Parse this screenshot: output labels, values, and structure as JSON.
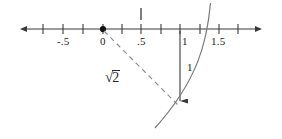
{
  "figure": {
    "stroke_color": "#3a3a3a",
    "dash_color": "#8a8a8a",
    "arc_color": "#7a7a7a",
    "text_color": "#1c1c1c",
    "background": "#ffffff"
  },
  "number_line": {
    "name": "real-number-line",
    "left_arrow": true,
    "right_arrow": true,
    "ticks": [
      {
        "label": "",
        "value": "-0.75"
      },
      {
        "label": "-.5",
        "value": "-0.5"
      },
      {
        "label": "",
        "value": "-0.25"
      },
      {
        "label": "0",
        "value": "0"
      },
      {
        "label": "",
        "value": "0.25"
      },
      {
        "label": ".5",
        "value": "0.5"
      },
      {
        "label": "",
        "value": "0.75"
      },
      {
        "label": "1",
        "value": "1"
      },
      {
        "label": "",
        "value": "1.25"
      },
      {
        "label": "1.5",
        "value": "1.5"
      },
      {
        "label": "",
        "value": "1.75"
      }
    ],
    "labels": {
      "neg_half": "-.5",
      "zero": "0",
      "half": ".5",
      "one": "1",
      "one_half": "1.5"
    },
    "origin_dot": {
      "name": "origin-point",
      "value": "0"
    },
    "upper_tick": {
      "name": "upper-tick-mark",
      "at_value": "0.5"
    }
  },
  "triangle": {
    "name": "right-triangle-construction",
    "vertical_leg_label": "1",
    "base_leg_label": "1",
    "hypotenuse_label_parts": {
      "radical": "√",
      "radicand": "2"
    },
    "hypotenuse_label_text": "√2"
  },
  "arc": {
    "name": "compass-arc",
    "description": "arc swept from hypotenuse endpoint",
    "crosses_axis_near": "1.41"
  }
}
